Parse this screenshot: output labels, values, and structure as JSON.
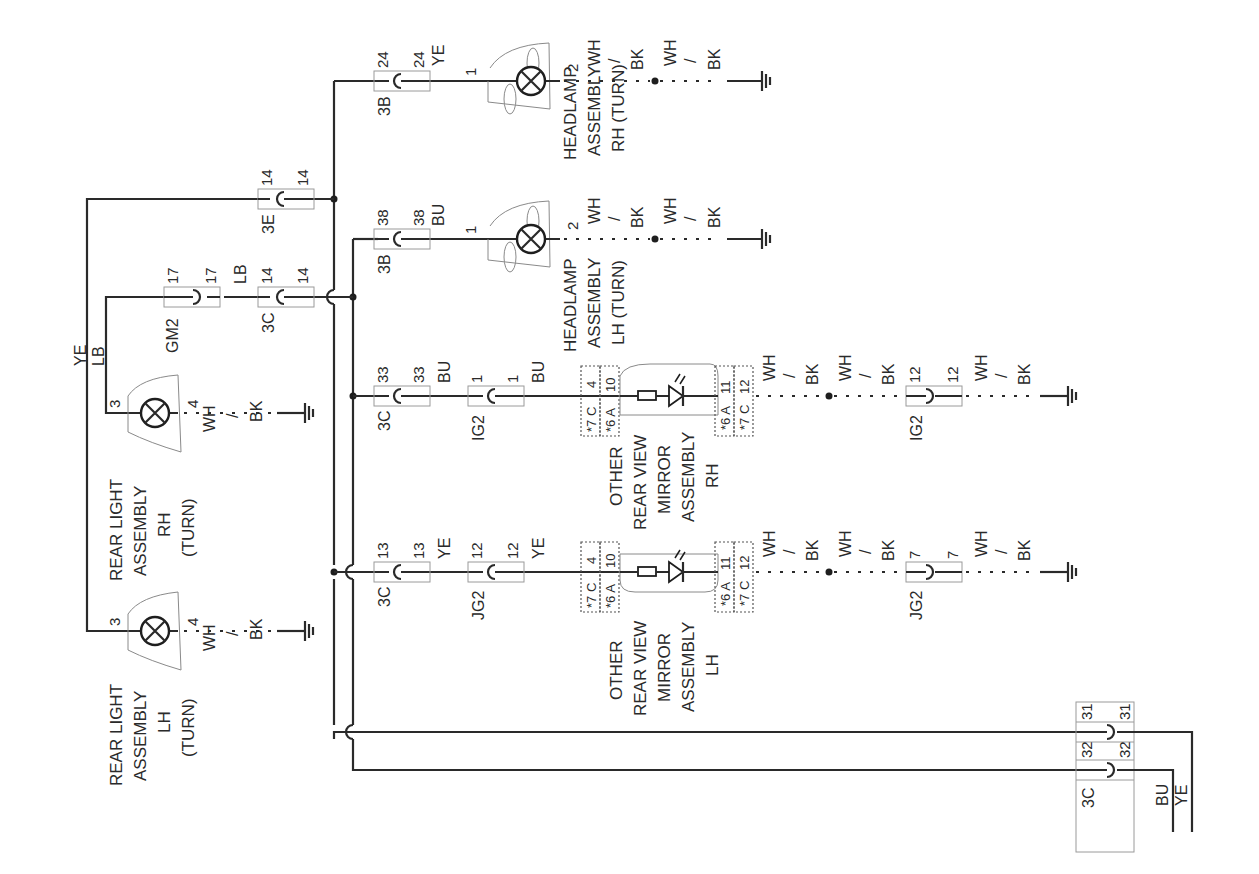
{
  "diagram": {
    "type": "wiring-diagram",
    "orientation": "rotated-90",
    "components": {
      "headlamp_rh": {
        "line1": "HEADLAMP",
        "line2": "ASSEMBLY",
        "line3": "RH (TURN)",
        "pin_in": "1",
        "pin_out": "2"
      },
      "headlamp_lh": {
        "line1": "HEADLAMP",
        "line2": "ASSEMBLY",
        "line3": "LH (TURN)",
        "pin_in": "1",
        "pin_out": "2"
      },
      "rear_light_rh": {
        "line1": "REAR LIGHT",
        "line2": "ASSEMBLY",
        "line3": "RH",
        "line4": "(TURN)",
        "pin_in": "3",
        "pin_out": "4"
      },
      "rear_light_lh": {
        "line1": "REAR LIGHT",
        "line2": "ASSEMBLY",
        "line3": "LH",
        "line4": "(TURN)",
        "pin_in": "3",
        "pin_out": "4"
      },
      "mirror_rh": {
        "line1": "OTHER",
        "line2": "REAR VIEW",
        "line3": "MIRROR",
        "line4": "ASSEMBLY",
        "line5": "RH",
        "in_a": "*7 C",
        "in_a_pin": "4",
        "in_b": "*6 A",
        "in_b_pin": "10",
        "out_a": "*6 A",
        "out_a_pin": "11",
        "out_b": "*7 C",
        "out_b_pin": "12"
      },
      "mirror_lh": {
        "line1": "OTHER",
        "line2": "REAR VIEW",
        "line3": "MIRROR",
        "line4": "ASSEMBLY",
        "line5": "LH",
        "in_a": "*7 C",
        "in_a_pin": "4",
        "in_b": "*6 A",
        "in_b_pin": "10",
        "out_a": "*6 A",
        "out_a_pin": "11",
        "out_b": "*7 C",
        "out_b_pin": "12"
      }
    },
    "connectors": {
      "c3b_24": {
        "name": "3B",
        "pin_a": "24",
        "pin_b": "24"
      },
      "c3e_14": {
        "name": "3E",
        "pin_a": "14",
        "pin_b": "14"
      },
      "c3b_38": {
        "name": "3B",
        "pin_a": "38",
        "pin_b": "38"
      },
      "cgm2_17": {
        "name": "GM2",
        "pin_a": "17",
        "pin_b": "17"
      },
      "c3c_14": {
        "name": "3C",
        "pin_a": "14",
        "pin_b": "14"
      },
      "c3c_33": {
        "name": "3C",
        "pin_a": "33",
        "pin_b": "33"
      },
      "cig2_1": {
        "name": "IG2",
        "pin_a": "1",
        "pin_b": "1"
      },
      "cig2_12": {
        "name": "IG2",
        "pin_a": "12",
        "pin_b": "12"
      },
      "c3c_13": {
        "name": "3C",
        "pin_a": "13",
        "pin_b": "13"
      },
      "cjg2_12": {
        "name": "JG2",
        "pin_a": "12",
        "pin_b": "12"
      },
      "cjg2_7": {
        "name": "JG2",
        "pin_a": "7",
        "pin_b": "7"
      },
      "c3c_31": {
        "name": "3C",
        "pin_a": "31",
        "pin_b": "31"
      },
      "c3c_32": {
        "name": "3C",
        "pin_a": "32",
        "pin_b": "32"
      }
    },
    "wire_colors": {
      "ye": "YE",
      "lb": "LB",
      "bu": "BU",
      "wh": "WH",
      "bk": "BK",
      "slash": "/"
    }
  }
}
